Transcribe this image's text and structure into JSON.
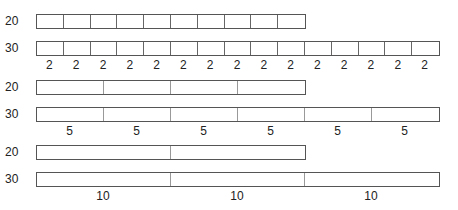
{
  "groups": [
    {
      "segment": 2,
      "rows": [
        {
          "label": "20",
          "length": 20,
          "cells": 10
        },
        {
          "label": "30",
          "length": 30,
          "cells": 15
        }
      ],
      "segment_labels": [
        "2",
        "2",
        "2",
        "2",
        "2",
        "2",
        "2",
        "2",
        "2",
        "2",
        "2",
        "2",
        "2",
        "2",
        "2"
      ]
    },
    {
      "segment": 5,
      "rows": [
        {
          "label": "20",
          "length": 20,
          "cells": 4
        },
        {
          "label": "30",
          "length": 30,
          "cells": 6
        }
      ],
      "segment_labels": [
        "5",
        "5",
        "5",
        "5",
        "5",
        "5"
      ]
    },
    {
      "segment": 10,
      "rows": [
        {
          "label": "20",
          "length": 20,
          "cells": 2
        },
        {
          "label": "30",
          "length": 30,
          "cells": 3
        }
      ],
      "segment_labels": [
        "10",
        "10",
        "10"
      ]
    }
  ],
  "unit_px": 13.4
}
